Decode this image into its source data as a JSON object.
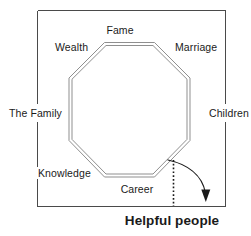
{
  "diagram": {
    "shape": "octagon",
    "frame_color": "#4a4a4a",
    "octagon_stroke_color": "#8c8c8c",
    "arrow_color": "#1a1a1a",
    "labels": [
      {
        "id": "fame",
        "text": "Fame",
        "position": "top"
      },
      {
        "id": "marriage",
        "text": "Marriage",
        "position": "top-right"
      },
      {
        "id": "children",
        "text": "Children",
        "position": "right"
      },
      {
        "id": "helpful",
        "text": "Helpful people",
        "position": "bottom-right"
      },
      {
        "id": "career",
        "text": "Career",
        "position": "bottom"
      },
      {
        "id": "knowledge",
        "text": "Knowledge",
        "position": "bottom-left"
      },
      {
        "id": "family",
        "text": "The Family",
        "position": "left"
      },
      {
        "id": "wealth",
        "text": "Wealth",
        "position": "top-left"
      }
    ],
    "annotations": {
      "dotted_guide": "dotted vertical line from octagon bottom-right vertex to frame base",
      "curved_arrow": "curved arrow from octagon bottom-right vertex to Helpful people area"
    }
  }
}
